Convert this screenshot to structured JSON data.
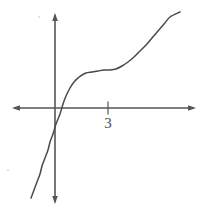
{
  "figure": {
    "width": 205,
    "height": 211,
    "background": "#ffffff",
    "line_color": "#555555",
    "curve_color": "#4a4a4a",
    "label_color": "#4a4a4a"
  },
  "axes": {
    "x_axis": {
      "name": "x-axis",
      "y_pixel": 108,
      "x_start_pixel": 12,
      "x_end_pixel": 196,
      "arrow_start": true,
      "arrow_end": true
    },
    "y_axis": {
      "name": "y-axis",
      "x_pixel": 55,
      "y_start_pixel": 13,
      "y_end_pixel": 204,
      "arrow_start": true,
      "arrow_end": true
    },
    "ticks": [
      {
        "axis": "x",
        "label": "3",
        "x_pixel": 108,
        "value": 3
      }
    ]
  },
  "chart_data": {
    "type": "line",
    "title": "",
    "subtitle": "",
    "xlabel": "",
    "ylabel": "",
    "grid": false,
    "legend": null,
    "axis_style": "arrow-tipped cartesian axes through origin",
    "origin_pixel": [
      55,
      108
    ],
    "x_tick_labels": [
      "3"
    ],
    "y_tick_labels": [],
    "xlim": [
      -2.4,
      8.4
    ],
    "ylim": [
      -5.1,
      5.4
    ],
    "series": [
      {
        "name": "cubic-curve",
        "color": "#4a4a4a",
        "x": [
          -1.3,
          -1.1,
          -0.9,
          -0.7,
          -0.5,
          -0.3,
          -0.1,
          0.1,
          0.3,
          0.6,
          0.9,
          1.2,
          1.5,
          1.8,
          2.1,
          2.4,
          2.7,
          3.0,
          3.3,
          3.6,
          3.9,
          4.2,
          4.5,
          4.8,
          5.1,
          5.4,
          5.7,
          6.0,
          6.3,
          6.6,
          6.9,
          7.2,
          7.4
        ],
        "y": [
          -4.9,
          -4.1,
          -3.3,
          -2.6,
          -1.9,
          -1.2,
          -0.4,
          0.3,
          0.9,
          1.6,
          2.1,
          2.4,
          2.6,
          2.7,
          2.75,
          2.78,
          2.79,
          2.8,
          2.81,
          2.84,
          2.9,
          3.0,
          3.15,
          3.35,
          3.6,
          3.85,
          4.1,
          4.35,
          4.6,
          4.85,
          5.1,
          5.3,
          5.45
        ],
        "pixel_points": [
          [
            31,
            198
          ],
          [
            34,
            190
          ],
          [
            37,
            182
          ],
          [
            40,
            174
          ],
          [
            42,
            166
          ],
          [
            45,
            158
          ],
          [
            48,
            150
          ],
          [
            50,
            142
          ],
          [
            53,
            134
          ],
          [
            56,
            124
          ],
          [
            60,
            114
          ],
          [
            63,
            104
          ],
          [
            66,
            96
          ],
          [
            70,
            88
          ],
          [
            74,
            82
          ],
          [
            78,
            78
          ],
          [
            82,
            75
          ],
          [
            86,
            73
          ],
          [
            92,
            72
          ],
          [
            98,
            71
          ],
          [
            104,
            70
          ],
          [
            110,
            70
          ],
          [
            116,
            69
          ],
          [
            122,
            66
          ],
          [
            128,
            62
          ],
          [
            134,
            57
          ],
          [
            140,
            51
          ],
          [
            146,
            45
          ],
          [
            152,
            38
          ],
          [
            158,
            31
          ],
          [
            164,
            24
          ],
          [
            170,
            17
          ],
          [
            180,
            12
          ]
        ]
      }
    ]
  },
  "annotations": {
    "specks": [
      {
        "name": "speck-top",
        "x_pixel": 38,
        "y_pixel": 16
      },
      {
        "name": "speck-left",
        "x_pixel": 7,
        "y_pixel": 169
      }
    ]
  }
}
